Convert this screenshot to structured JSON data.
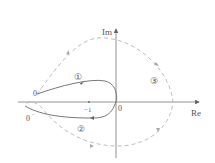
{
  "diagram": {
    "type": "nyquist-contour",
    "axes": {
      "x_label": "Re",
      "y_label": "Im",
      "origin_label": "0"
    },
    "point_labels": {
      "minus_one": "−1",
      "zero_plus": "0",
      "zero_plus_sup": "+",
      "zero_minus": "0",
      "zero_minus_sup": "−"
    },
    "region_labels": [
      "①",
      "②",
      "③"
    ],
    "colors": {
      "axis": "#666666",
      "solid_curve": "#666666",
      "dashed_curve": "#b0b0b0",
      "text": "#555555"
    }
  }
}
